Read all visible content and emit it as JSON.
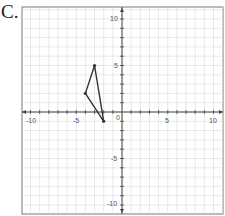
{
  "problem": {
    "label": "C."
  },
  "chart_data": {
    "type": "line",
    "title": "",
    "xlabel": "",
    "ylabel": "",
    "xlim": [
      -11,
      11
    ],
    "ylim": [
      -11,
      11
    ],
    "grid": true,
    "x_tick_labels": [
      "-10",
      "-5",
      "0",
      "5",
      "10"
    ],
    "y_tick_labels": [
      "10",
      "5",
      "-5",
      "-10"
    ],
    "series": [
      {
        "name": "triangle",
        "shape": "closed-polygon",
        "points": [
          [
            -3,
            5
          ],
          [
            -4,
            2
          ],
          [
            -2,
            -1
          ]
        ],
        "color": "#333333"
      }
    ]
  },
  "axis_labels": {
    "x_neg10": "-10",
    "x_neg5": "-5",
    "x_0": "0",
    "x_5": "5",
    "x_10": "10",
    "y_10": "10",
    "y_5": "5",
    "y_neg5": "-5",
    "y_neg10": "-10"
  }
}
